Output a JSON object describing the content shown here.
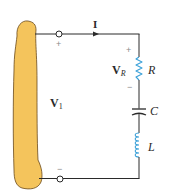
{
  "diagram": {
    "type": "series RLC circuit",
    "source": {
      "label": "V",
      "subscript": "1",
      "plus_sign": "+",
      "minus_sign": "−"
    },
    "current": {
      "label": "I",
      "direction": "clockwise (left to right on top wire)"
    },
    "components": [
      {
        "id": "R",
        "label": "R",
        "kind": "resistor",
        "voltage_label": "V",
        "voltage_subscript": "R",
        "plus_sign": "+",
        "minus_sign": "−"
      },
      {
        "id": "C",
        "label": "C",
        "kind": "capacitor"
      },
      {
        "id": "L",
        "label": "L",
        "kind": "inductor"
      }
    ]
  },
  "colors": {
    "source_fill": "#f4c45c",
    "source_stroke": "#6b4a1a",
    "wire": "#2a2a2a",
    "component": "#3aa0d8",
    "text": "#2a2a2a",
    "sign": "#8a8a8a"
  }
}
